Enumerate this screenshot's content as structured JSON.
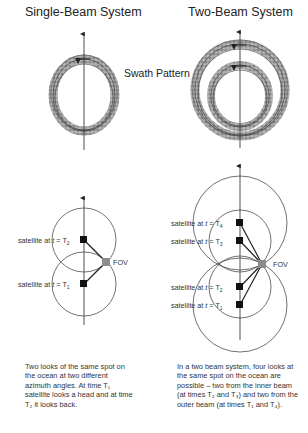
{
  "titles": {
    "left": "Single-Beam System",
    "right": "Two-Beam System"
  },
  "swath_label": {
    "left_part": "Swath",
    "right_part": "Pattern"
  },
  "single_beam": {
    "labels": [
      {
        "prefix": "satellite at ",
        "t": "t",
        "eq": " = T",
        "sub": "2"
      },
      {
        "prefix": "satellite at ",
        "t": "t",
        "eq": " = T",
        "sub": "1"
      }
    ],
    "fov": "FOV",
    "caption": "Two looks of the same spot on the ocean at two different azimuth angles. At time T₁ satellite looks a head and at time T₂ it looks back."
  },
  "two_beam": {
    "labels": [
      {
        "prefix": "satellite at ",
        "t": "t",
        "eq": " = T",
        "sub": "4"
      },
      {
        "prefix": "satellite at ",
        "t": "t",
        "eq": " = T",
        "sub": "3"
      },
      {
        "prefix": "satellite at ",
        "t": "t",
        "eq": " = T",
        "sub": "2"
      },
      {
        "prefix": "satellite at ",
        "t": "t",
        "eq": " = T",
        "sub": "1"
      }
    ],
    "fov": "FOV",
    "caption": "In a two beam system, four looks at the same spot on the ocean are possible – two from the inner beam (at times T₂ and T₃) and two from the outer beam (at times T₁ and T₄)."
  },
  "colors": {
    "line": "#222222",
    "bead": "#9a9a9a",
    "fov": "#8c8c8c"
  }
}
